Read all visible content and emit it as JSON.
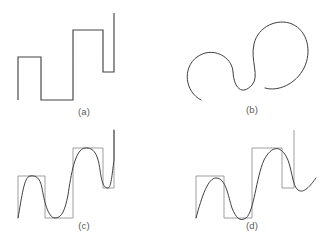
{
  "figure": {
    "background_color": "#ffffff",
    "line_color": "#444444",
    "box_color": "#8f8f8f",
    "width": 336,
    "height": 241
  },
  "panels": [
    {
      "id": "a",
      "label": "(a)",
      "caption": "(a)",
      "description": "ascending square-wave staircase, sharp corners"
    },
    {
      "id": "b",
      "label": "(b)",
      "caption": "(b)",
      "description": "smooth rounded looping curve, ascending S-shaped spiral"
    },
    {
      "id": "c",
      "label": "(c)",
      "caption": "(c)",
      "description": "square-wave outline with flat-topped smooth approximation overlaid"
    },
    {
      "id": "d",
      "label": "(d)",
      "caption": "(d)",
      "description": "square-wave outline with sinusoidal smooth approximation overlaid"
    }
  ],
  "chart_data": {
    "type": "line",
    "title": "",
    "xlabel": "",
    "ylabel": "",
    "grid": false,
    "legend": "none",
    "panel_a": {
      "type": "line",
      "name": "staircase square wave",
      "xlim": [
        0,
        168
      ],
      "ylim": [
        0,
        122
      ],
      "polyline": "18,100 18,57 41,57 41,100 73,100 73,30 103,30 103,72 114,72 114,13",
      "points": [
        [
          18,
          100
        ],
        [
          18,
          57
        ],
        [
          41,
          57
        ],
        [
          41,
          100
        ],
        [
          73,
          100
        ],
        [
          73,
          30
        ],
        [
          103,
          30
        ],
        [
          103,
          72
        ],
        [
          114,
          72
        ],
        [
          114,
          13
        ]
      ]
    },
    "panel_b": {
      "type": "line",
      "name": "smoothed loop curve",
      "xlim": [
        168,
        336
      ],
      "ylim": [
        0,
        122
      ],
      "path": "M 201,100 C 185,92 182,68 197,57 C 212,46 232,56 233,72 C 234,88 242,96 252,85 C 260,76 250,60 254,44 C 258,26 278,18 292,24 C 308,31 312,52 304,68 C 296,84 278,92 265,88"
    },
    "panel_c": {
      "type": "line",
      "name": "square wave with flat-top Fourier approximation",
      "xlim": [
        0,
        168
      ],
      "ylim": [
        122,
        241
      ],
      "box_segments": [
        "18,218 18,176 45,176 45,218",
        "45,218 73,218 73,148 103,148 103,188",
        "103,188 114,188 114,130"
      ],
      "square_polyline": "18,218 18,176 45,176 45,218 73,218 73,148 103,148 103,188 114,188 114,130",
      "smooth_path": "M 18,218 C 22,196 24,177 30,176 C 36,175 40,178 42,188 C 44,200 48,218 55,218 C 62,218 65,210 68,195 C 71,175 75,149 85,148 C 94,147 98,155 100,170 C 102,184 104,188 108,188 C 111,188 112,175 114,160 L 114,130"
    },
    "panel_d": {
      "type": "line",
      "name": "square wave with sinusoidal approximation",
      "xlim": [
        168,
        336
      ],
      "ylim": [
        122,
        241
      ],
      "square_polyline": "196,218 196,176 224,176 224,218 252,218 252,148 282,148 282,188 294,188 294,130",
      "smooth_path": "M 196,218 C 202,196 208,178 216,178 C 226,178 228,196 232,208 C 236,218 240,222 246,218 C 254,212 256,178 264,160 C 272,145 280,146 286,156 C 292,166 292,186 298,190 C 304,194 310,186 316,178"
    }
  }
}
